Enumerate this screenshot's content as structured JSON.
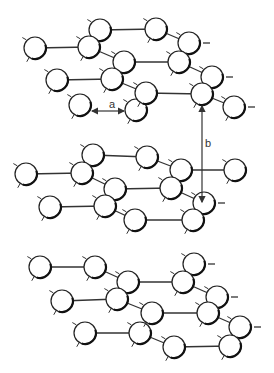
{
  "diagram": {
    "colors": {
      "line": "#333333",
      "atom_fill": "#ffffff",
      "background": "#ffffff"
    },
    "atom_radius": 11,
    "labels": [
      {
        "id": "a",
        "text": "a",
        "x": 109,
        "y": 108
      },
      {
        "id": "b",
        "text": "b",
        "x": 205,
        "y": 147
      }
    ],
    "dimension_arrows": [
      {
        "id": "a",
        "x1": 92,
        "y1": 111,
        "x2": 124,
        "y2": 111,
        "double": true
      },
      {
        "id": "b",
        "x1": 202,
        "y1": 106,
        "x2": 202,
        "y2": 202,
        "double": true
      }
    ],
    "layers": [
      {
        "name": "top-layer",
        "atoms": [
          [
            35,
            48
          ],
          [
            100,
            30
          ],
          [
            89,
            47
          ],
          [
            124,
            62
          ],
          [
            57,
            80
          ],
          [
            112,
            79
          ],
          [
            80,
            105
          ],
          [
            136,
            110
          ],
          [
            156,
            29
          ],
          [
            189,
            43
          ],
          [
            179,
            62
          ],
          [
            212,
            77
          ],
          [
            146,
            93
          ],
          [
            202,
            94
          ],
          [
            234,
            107
          ]
        ],
        "bonds": [
          [
            0,
            2
          ],
          [
            1,
            8
          ],
          [
            2,
            1
          ],
          [
            2,
            3
          ],
          [
            8,
            9
          ],
          [
            9,
            10
          ],
          [
            3,
            10
          ],
          [
            4,
            5
          ],
          [
            5,
            3
          ],
          [
            5,
            12
          ],
          [
            12,
            13
          ],
          [
            10,
            11
          ],
          [
            11,
            13
          ],
          [
            13,
            14
          ],
          [
            12,
            7
          ]
        ],
        "side_ticks": [
          [
            9,
            "r"
          ],
          [
            11,
            "r"
          ],
          [
            14,
            "r"
          ]
        ]
      },
      {
        "name": "middle-layer",
        "atoms": [
          [
            26,
            174
          ],
          [
            93,
            155
          ],
          [
            82,
            173
          ],
          [
            115,
            189
          ],
          [
            50,
            207
          ],
          [
            105,
            206
          ],
          [
            135,
            220
          ],
          [
            147,
            157
          ],
          [
            181,
            170
          ],
          [
            235,
            170
          ],
          [
            171,
            188
          ],
          [
            204,
            203
          ],
          [
            193,
            220
          ]
        ],
        "bonds": [
          [
            0,
            2
          ],
          [
            1,
            7
          ],
          [
            2,
            1
          ],
          [
            2,
            3
          ],
          [
            7,
            8
          ],
          [
            8,
            9
          ],
          [
            3,
            10
          ],
          [
            4,
            5
          ],
          [
            5,
            3
          ],
          [
            5,
            6
          ],
          [
            10,
            11
          ],
          [
            6,
            12
          ],
          [
            10,
            8
          ]
        ],
        "side_ticks": [
          [
            11,
            "r"
          ]
        ]
      },
      {
        "name": "bottom-layer",
        "atoms": [
          [
            40,
            267
          ],
          [
            95,
            267
          ],
          [
            128,
            282
          ],
          [
            62,
            301
          ],
          [
            117,
            299
          ],
          [
            85,
            333
          ],
          [
            140,
            333
          ],
          [
            194,
            264
          ],
          [
            183,
            282
          ],
          [
            217,
            297
          ],
          [
            152,
            313
          ],
          [
            208,
            313
          ],
          [
            240,
            327
          ],
          [
            174,
            347
          ],
          [
            230,
            346
          ]
        ],
        "bonds": [
          [
            0,
            1
          ],
          [
            1,
            2
          ],
          [
            2,
            8
          ],
          [
            8,
            7
          ],
          [
            8,
            9
          ],
          [
            3,
            4
          ],
          [
            4,
            2
          ],
          [
            4,
            10
          ],
          [
            10,
            11
          ],
          [
            11,
            9
          ],
          [
            11,
            12
          ],
          [
            5,
            6
          ],
          [
            6,
            10
          ],
          [
            6,
            13
          ],
          [
            13,
            14
          ],
          [
            14,
            12
          ]
        ],
        "side_ticks": [
          [
            7,
            "r"
          ],
          [
            9,
            "r"
          ],
          [
            12,
            "r"
          ]
        ]
      }
    ]
  }
}
